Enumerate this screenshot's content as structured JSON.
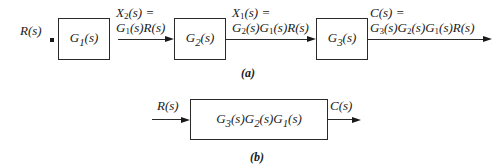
{
  "diagram_a": {
    "caption": "(a)",
    "input_label": "R(s)",
    "blocks": [
      {
        "id": "G1",
        "label": "G1(s)"
      },
      {
        "id": "G2",
        "label": "G2(s)"
      },
      {
        "id": "G3",
        "label": "G3(s)"
      }
    ],
    "signals": [
      {
        "line1": "X2(s) =",
        "line2": "G1(s)R(s)"
      },
      {
        "line1": "X1(s) =",
        "line2": "G2(s)G1(s)R(s)"
      },
      {
        "line1": "C(s) =",
        "line2": "G3(s)G2(s)G1(s)R(s)"
      }
    ]
  },
  "diagram_b": {
    "caption": "(b)",
    "input_label": "R(s)",
    "block_label": "G3(s)G2(s)G1(s)",
    "output_label": "C(s)"
  },
  "colors": {
    "line": "#2a2a2a",
    "text": "#1a1a1a",
    "background": "#ffffff"
  }
}
